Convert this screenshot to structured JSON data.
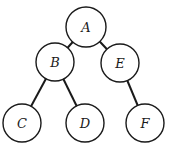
{
  "diagram": {
    "type": "tree",
    "nodes": [
      {
        "id": "A",
        "label": "A",
        "x": 86,
        "y": 27,
        "r": 20
      },
      {
        "id": "B",
        "label": "B",
        "x": 55,
        "y": 62,
        "r": 19
      },
      {
        "id": "E",
        "label": "E",
        "x": 120,
        "y": 63,
        "r": 19
      },
      {
        "id": "C",
        "label": "C",
        "x": 22,
        "y": 123,
        "r": 19
      },
      {
        "id": "D",
        "label": "D",
        "x": 85,
        "y": 123,
        "r": 19
      },
      {
        "id": "F",
        "label": "F",
        "x": 145,
        "y": 123,
        "r": 19
      }
    ],
    "edges": [
      {
        "from": "A",
        "to": "B"
      },
      {
        "from": "A",
        "to": "E"
      },
      {
        "from": "B",
        "to": "C"
      },
      {
        "from": "B",
        "to": "D"
      },
      {
        "from": "E",
        "to": "F"
      }
    ]
  }
}
